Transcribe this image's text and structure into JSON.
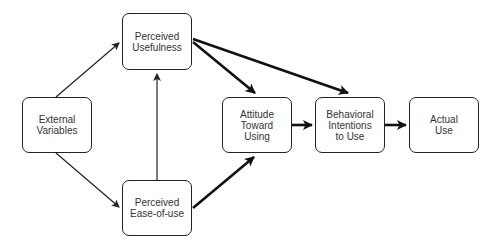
{
  "diagram": {
    "nodes": [
      {
        "id": "external",
        "label": "External\nVariables",
        "x": 22,
        "y": 97,
        "w": 70,
        "h": 56
      },
      {
        "id": "usefulness",
        "label": "Perceived\nUsefulness",
        "x": 122,
        "y": 13,
        "w": 70,
        "h": 57
      },
      {
        "id": "ease",
        "label": "Perceived\nEase-of-use",
        "x": 122,
        "y": 180,
        "w": 70,
        "h": 56
      },
      {
        "id": "attitude",
        "label": "Attitude\nToward\nUsing",
        "x": 222,
        "y": 97,
        "w": 70,
        "h": 56
      },
      {
        "id": "intentions",
        "label": "Behavioral\nIntentions\nto Use",
        "x": 315,
        "y": 97,
        "w": 70,
        "h": 56
      },
      {
        "id": "actual",
        "label": "Actual\nUse",
        "x": 409,
        "y": 97,
        "w": 70,
        "h": 56
      }
    ],
    "edges": [
      {
        "from": "external",
        "to": "usefulness",
        "weight": "thin"
      },
      {
        "from": "external",
        "to": "ease",
        "weight": "thin"
      },
      {
        "from": "ease",
        "to": "usefulness",
        "weight": "thin"
      },
      {
        "from": "usefulness",
        "to": "attitude",
        "weight": "thick"
      },
      {
        "from": "usefulness",
        "to": "intentions",
        "weight": "thick"
      },
      {
        "from": "ease",
        "to": "attitude",
        "weight": "thick"
      },
      {
        "from": "attitude",
        "to": "intentions",
        "weight": "thick"
      },
      {
        "from": "intentions",
        "to": "actual",
        "weight": "thick"
      }
    ],
    "colors": {
      "stroke": "#222222",
      "text": "#333333",
      "background": "#ffffff"
    }
  }
}
